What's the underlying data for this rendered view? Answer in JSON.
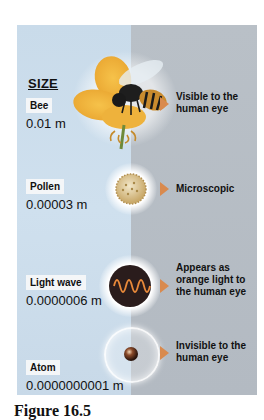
{
  "figure": {
    "heading": "SIZE",
    "caption": "Figure 16.5",
    "colors": {
      "left_bg": "#cfe0ee",
      "right_bg": "#b5bcc4",
      "arrow": "#d98a4e",
      "wave_bg": "#2a1c1c",
      "wave_line": "#e8893a"
    },
    "items": [
      {
        "name": "Bee",
        "size": "0.01 m",
        "description": "Visible to the human eye",
        "desc_lines": [
          "Visible to the",
          "human eye"
        ],
        "icon": "bee-on-flower-icon"
      },
      {
        "name": "Pollen",
        "size": "0.00003 m",
        "description": "Microscopic",
        "desc_lines": [
          "Microscopic"
        ],
        "icon": "pollen-grain-icon"
      },
      {
        "name": "Light wave",
        "size": "0.0000006 m",
        "description": "Appears as orange light to the human eye",
        "desc_lines": [
          "Appears as",
          "orange light to",
          "the human eye"
        ],
        "icon": "sine-wave-icon"
      },
      {
        "name": "Atom",
        "size": "0.0000000001 m",
        "description": "Invisible to the human eye",
        "desc_lines": [
          "Invisible to the",
          "human eye"
        ],
        "icon": "atom-sphere-icon"
      }
    ]
  }
}
